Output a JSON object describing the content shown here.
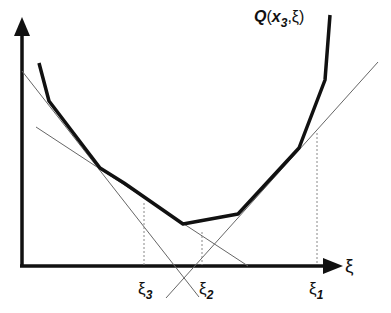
{
  "diagram": {
    "function_label": {
      "name": "Q",
      "arg1": "x",
      "arg1_sub": "3",
      "sep": ",",
      "arg2": "ξ",
      "open": "(",
      "close": ")"
    },
    "x_axis_label": "ξ",
    "points": [
      {
        "symbol": "ξ",
        "sub": "3"
      },
      {
        "symbol": "ξ",
        "sub": "2"
      },
      {
        "symbol": "ξ",
        "sub": "1"
      }
    ],
    "colors": {
      "curve": "#111111",
      "axis": "#111111",
      "tangent": "#555555",
      "dotted": "#777777"
    }
  }
}
